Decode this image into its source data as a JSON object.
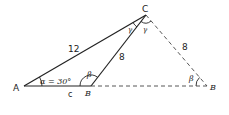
{
  "diagram": {
    "type": "ambiguous-case triangle (SSA)",
    "vertices": {
      "A": {
        "label": "A"
      },
      "C": {
        "label": "C"
      },
      "B1": {
        "label": "B"
      },
      "B2": {
        "label": "B"
      }
    },
    "sides": {
      "AC": "12",
      "CB1": "8",
      "CB2": "8",
      "AB": "c"
    },
    "angles": {
      "alpha": "α = 30°",
      "beta1": "β",
      "beta2": "β",
      "gamma1": "γ",
      "gamma2": "γ"
    },
    "colors": {
      "line": "#222222",
      "background": "#ffffff"
    }
  }
}
